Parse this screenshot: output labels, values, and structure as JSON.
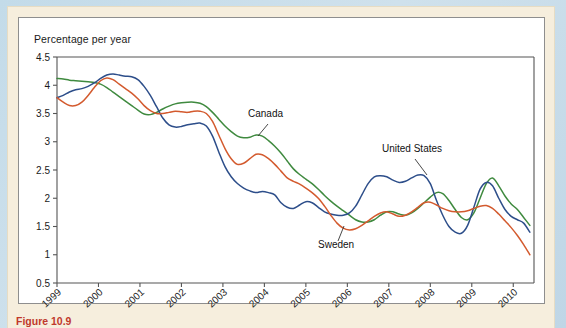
{
  "figure": {
    "caption": "Figure 10.9",
    "caption_color": "#c0392b",
    "frame_color": "#f6eedd",
    "outer_color": "#c3dbe9"
  },
  "chart_data": {
    "type": "line",
    "title": "",
    "subtitle": "",
    "xlabel": "",
    "ylabel": "Percentage per year",
    "ylim": [
      0.5,
      4.5
    ],
    "xlim": [
      1999,
      2010.5
    ],
    "grid": false,
    "legend_position": "inline-annotations",
    "y_ticks": [
      "4.5",
      "4",
      "3.5",
      "3",
      "2.5",
      "2",
      "1.5",
      "1",
      "0.5"
    ],
    "y_tick_values": [
      4.5,
      4,
      3.5,
      3,
      2.5,
      2,
      1.5,
      1,
      0.5
    ],
    "x_ticks": [
      "1999",
      "2000",
      "2001",
      "2002",
      "2003",
      "2004",
      "2005",
      "2006",
      "2007",
      "2008",
      "2009",
      "2010"
    ],
    "x_tick_values": [
      1999,
      2000,
      2001,
      2002,
      2003,
      2004,
      2005,
      2006,
      2007,
      2008,
      2009,
      2010
    ],
    "annotations": [
      {
        "label": "Canada",
        "series": "Canada",
        "x": 2003.55,
        "y": 3.08
      },
      {
        "label": "United States",
        "series": "United States",
        "x": 2007.62,
        "y": 2.42
      },
      {
        "label": "Sweden",
        "series": "Sweden",
        "x": 2005.8,
        "y": 1.45
      }
    ],
    "series": [
      {
        "name": "Canada",
        "color": "#3f8a3f",
        "x": [
          1999.0,
          1999.15,
          1999.3,
          1999.45,
          1999.6,
          1999.75,
          1999.9,
          2000.05,
          2000.2,
          2000.35,
          2000.5,
          2000.65,
          2000.8,
          2000.95,
          2001.1,
          2001.25,
          2001.4,
          2001.55,
          2001.7,
          2001.85,
          2002.0,
          2002.15,
          2002.3,
          2002.45,
          2002.6,
          2002.75,
          2002.9,
          2003.05,
          2003.2,
          2003.35,
          2003.5,
          2003.65,
          2003.8,
          2003.95,
          2004.1,
          2004.25,
          2004.4,
          2004.55,
          2004.7,
          2004.85,
          2005.0,
          2005.15,
          2005.3,
          2005.45,
          2005.6,
          2005.75,
          2005.9,
          2006.05,
          2006.2,
          2006.35,
          2006.5,
          2006.65,
          2006.8,
          2006.95,
          2007.1,
          2007.25,
          2007.4,
          2007.55,
          2007.7,
          2007.85,
          2008.0,
          2008.15,
          2008.3,
          2008.45,
          2008.6,
          2008.75,
          2008.9,
          2009.05,
          2009.2,
          2009.35,
          2009.5,
          2009.65,
          2009.8,
          2009.95,
          2010.1,
          2010.25,
          2010.4
        ],
        "y": [
          4.12,
          4.11,
          4.09,
          4.08,
          4.07,
          4.06,
          4.05,
          4.02,
          3.96,
          3.88,
          3.8,
          3.72,
          3.64,
          3.56,
          3.49,
          3.48,
          3.52,
          3.58,
          3.63,
          3.67,
          3.69,
          3.7,
          3.7,
          3.68,
          3.62,
          3.52,
          3.4,
          3.28,
          3.18,
          3.1,
          3.07,
          3.08,
          3.12,
          3.1,
          3.02,
          2.92,
          2.8,
          2.66,
          2.52,
          2.42,
          2.34,
          2.26,
          2.16,
          2.05,
          1.95,
          1.86,
          1.78,
          1.7,
          1.62,
          1.58,
          1.58,
          1.62,
          1.7,
          1.76,
          1.76,
          1.72,
          1.7,
          1.74,
          1.82,
          1.92,
          2.02,
          2.1,
          2.08,
          1.96,
          1.8,
          1.66,
          1.62,
          1.74,
          2.0,
          2.26,
          2.36,
          2.22,
          2.04,
          1.9,
          1.8,
          1.66,
          1.52
        ]
      },
      {
        "name": "United States",
        "color": "#2d4e8a",
        "x": [
          1999.0,
          1999.15,
          1999.3,
          1999.45,
          1999.6,
          1999.75,
          1999.9,
          2000.05,
          2000.2,
          2000.35,
          2000.5,
          2000.65,
          2000.8,
          2000.95,
          2001.1,
          2001.25,
          2001.4,
          2001.55,
          2001.7,
          2001.85,
          2002.0,
          2002.15,
          2002.3,
          2002.45,
          2002.6,
          2002.75,
          2002.9,
          2003.05,
          2003.2,
          2003.35,
          2003.5,
          2003.65,
          2003.8,
          2003.95,
          2004.1,
          2004.25,
          2004.4,
          2004.55,
          2004.7,
          2004.85,
          2005.0,
          2005.15,
          2005.3,
          2005.45,
          2005.6,
          2005.75,
          2005.9,
          2006.05,
          2006.2,
          2006.35,
          2006.5,
          2006.65,
          2006.8,
          2006.95,
          2007.1,
          2007.25,
          2007.4,
          2007.55,
          2007.7,
          2007.85,
          2008.0,
          2008.15,
          2008.3,
          2008.45,
          2008.6,
          2008.75,
          2008.9,
          2009.05,
          2009.2,
          2009.35,
          2009.5,
          2009.65,
          2009.8,
          2009.95,
          2010.1,
          2010.25,
          2010.4
        ],
        "y": [
          3.78,
          3.82,
          3.88,
          3.92,
          3.94,
          3.98,
          4.04,
          4.12,
          4.18,
          4.2,
          4.18,
          4.16,
          4.15,
          4.1,
          3.98,
          3.82,
          3.62,
          3.42,
          3.3,
          3.26,
          3.27,
          3.3,
          3.32,
          3.33,
          3.28,
          3.1,
          2.82,
          2.56,
          2.38,
          2.26,
          2.18,
          2.13,
          2.1,
          2.12,
          2.1,
          2.06,
          1.92,
          1.84,
          1.82,
          1.88,
          1.94,
          1.92,
          1.84,
          1.76,
          1.72,
          1.7,
          1.7,
          1.74,
          1.86,
          2.06,
          2.26,
          2.38,
          2.4,
          2.38,
          2.32,
          2.28,
          2.3,
          2.36,
          2.41,
          2.4,
          2.26,
          1.96,
          1.7,
          1.5,
          1.4,
          1.38,
          1.52,
          1.84,
          2.16,
          2.28,
          2.22,
          2.0,
          1.8,
          1.68,
          1.62,
          1.56,
          1.4
        ]
      },
      {
        "name": "Sweden",
        "color": "#d35a2e",
        "x": [
          1999.0,
          1999.15,
          1999.3,
          1999.45,
          1999.6,
          1999.75,
          1999.9,
          2000.05,
          2000.2,
          2000.35,
          2000.5,
          2000.65,
          2000.8,
          2000.95,
          2001.1,
          2001.25,
          2001.4,
          2001.55,
          2001.7,
          2001.85,
          2002.0,
          2002.15,
          2002.3,
          2002.45,
          2002.6,
          2002.75,
          2002.9,
          2003.05,
          2003.2,
          2003.35,
          2003.5,
          2003.65,
          2003.8,
          2003.95,
          2004.1,
          2004.25,
          2004.4,
          2004.55,
          2004.7,
          2004.85,
          2005.0,
          2005.15,
          2005.3,
          2005.45,
          2005.6,
          2005.75,
          2005.9,
          2006.05,
          2006.2,
          2006.35,
          2006.5,
          2006.65,
          2006.8,
          2006.95,
          2007.1,
          2007.25,
          2007.4,
          2007.55,
          2007.7,
          2007.85,
          2008.0,
          2008.15,
          2008.3,
          2008.45,
          2008.6,
          2008.75,
          2008.9,
          2009.05,
          2009.2,
          2009.35,
          2009.5,
          2009.65,
          2009.8,
          2009.95,
          2010.1,
          2010.25,
          2010.4
        ],
        "y": [
          3.78,
          3.7,
          3.64,
          3.64,
          3.7,
          3.82,
          3.96,
          4.08,
          4.13,
          4.1,
          4.02,
          3.94,
          3.86,
          3.76,
          3.64,
          3.55,
          3.5,
          3.5,
          3.52,
          3.54,
          3.53,
          3.52,
          3.54,
          3.54,
          3.5,
          3.36,
          3.12,
          2.88,
          2.7,
          2.6,
          2.62,
          2.7,
          2.78,
          2.77,
          2.7,
          2.6,
          2.48,
          2.36,
          2.3,
          2.25,
          2.18,
          2.1,
          2.0,
          1.86,
          1.7,
          1.56,
          1.47,
          1.44,
          1.46,
          1.52,
          1.6,
          1.68,
          1.74,
          1.76,
          1.72,
          1.68,
          1.7,
          1.76,
          1.84,
          1.92,
          1.93,
          1.88,
          1.82,
          1.78,
          1.76,
          1.76,
          1.78,
          1.82,
          1.86,
          1.87,
          1.82,
          1.72,
          1.6,
          1.48,
          1.34,
          1.18,
          1.0
        ]
      }
    ]
  }
}
